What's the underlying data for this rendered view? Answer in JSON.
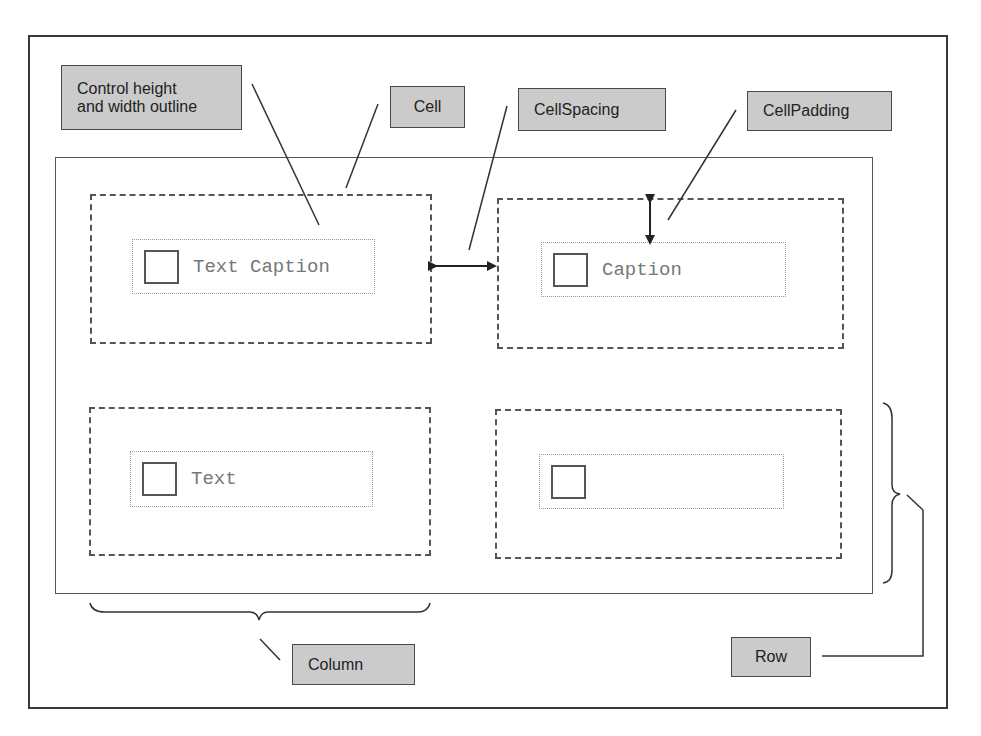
{
  "diagram": {
    "callouts": {
      "control_outline": "Control height\nand width outline",
      "cell": "Cell",
      "cell_spacing": "CellSpacing",
      "cell_padding": "CellPadding",
      "column": "Column",
      "row": "Row"
    },
    "cells": [
      {
        "caption": "Text Caption"
      },
      {
        "caption": "Caption"
      },
      {
        "caption": "Text"
      },
      {
        "caption": ""
      }
    ],
    "colors": {
      "label_fill": "#cbcbcb",
      "label_border": "#4a4a4a",
      "line": "#333333"
    }
  }
}
